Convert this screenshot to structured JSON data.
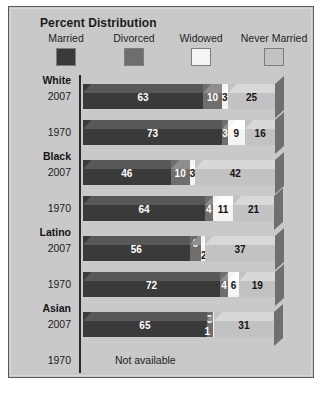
{
  "title": "Percent Distribution",
  "legend": {
    "items": [
      {
        "label": "Married",
        "color": "#3a3a3a"
      },
      {
        "label": "Divorced",
        "color": "#6e6e6e"
      },
      {
        "label": "Widowed",
        "color": "#f4f4f2"
      },
      {
        "label": "Never Married",
        "color": "#c2c2c2"
      }
    ]
  },
  "not_available_text": "Not available",
  "groups": [
    {
      "name": "White",
      "rows": [
        {
          "year": "2007"
        },
        {
          "year": "1970"
        }
      ]
    },
    {
      "name": "Black",
      "rows": [
        {
          "year": "2007"
        },
        {
          "year": "1970"
        }
      ]
    },
    {
      "name": "Latino",
      "rows": [
        {
          "year": "2007"
        },
        {
          "year": "1970"
        }
      ]
    },
    {
      "name": "Asian",
      "rows": [
        {
          "year": "2007"
        },
        {
          "year": "1970"
        }
      ]
    }
  ],
  "chart_data": {
    "type": "bar",
    "title": "Percent Distribution",
    "orientation": "horizontal",
    "stacked": true,
    "xlabel": "",
    "ylabel": "",
    "xlim": [
      0,
      100
    ],
    "grid": false,
    "legend_position": "top",
    "categories": [
      "White 2007",
      "White 1970",
      "Black 2007",
      "Black 1970",
      "Latino 2007",
      "Latino 1970",
      "Asian 2007",
      "Asian 1970"
    ],
    "series": [
      {
        "name": "Married",
        "color": "#3a3a3a",
        "values": [
          63,
          73,
          46,
          64,
          56,
          72,
          65,
          null
        ]
      },
      {
        "name": "Divorced",
        "color": "#6e6e6e",
        "values": [
          10,
          3,
          10,
          4,
          6,
          4,
          3,
          null
        ]
      },
      {
        "name": "Widowed",
        "color": "#f4f4f2",
        "values": [
          3,
          9,
          3,
          11,
          2,
          6,
          1,
          null
        ]
      },
      {
        "name": "Never Married",
        "color": "#c2c2c2",
        "values": [
          25,
          16,
          42,
          21,
          37,
          19,
          31,
          null
        ]
      }
    ],
    "annotations": [
      {
        "category": "Asian 1970",
        "text": "Not available"
      }
    ]
  }
}
